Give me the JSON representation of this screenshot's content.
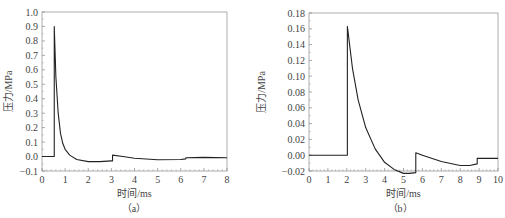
{
  "chart_data": [
    {
      "type": "line",
      "panel": "a",
      "caption": "（a）",
      "title": "",
      "xlabel": "时间/ms",
      "ylabel": "压力/MPa",
      "xlim": [
        0,
        8
      ],
      "ylim": [
        -0.1,
        1.0
      ],
      "xticks": [
        "0",
        "1",
        "2",
        "3",
        "4",
        "5",
        "6",
        "7",
        "8"
      ],
      "yticks": [
        "1.0",
        "0.9",
        "0.8",
        "0.7",
        "0.6",
        "0.5",
        "0.4",
        "0.3",
        "0.2",
        "0.1",
        "0.0",
        "−0.1"
      ],
      "grid": false,
      "legend": null,
      "series": [
        {
          "name": "pressure",
          "x": [
            0,
            0.53,
            0.53,
            0.6,
            0.7,
            0.8,
            0.9,
            1.0,
            1.2,
            1.5,
            2.0,
            2.5,
            3.0,
            3.05,
            3.05,
            3.5,
            4.0,
            5.0,
            6.0,
            6.22,
            6.22,
            7.0,
            8.0
          ],
          "y": [
            0.0,
            0.0,
            0.9,
            0.55,
            0.3,
            0.16,
            0.09,
            0.05,
            0.01,
            -0.02,
            -0.035,
            -0.035,
            -0.03,
            -0.03,
            0.01,
            0.0,
            -0.012,
            -0.022,
            -0.02,
            -0.016,
            -0.008,
            -0.006,
            -0.008
          ]
        }
      ]
    },
    {
      "type": "line",
      "panel": "b",
      "caption": "（b）",
      "title": "",
      "xlabel": "时间/ms",
      "ylabel": "压力/MPa",
      "xlim": [
        0,
        10
      ],
      "ylim": [
        -0.02,
        0.18
      ],
      "xticks": [
        "0",
        "1",
        "2",
        "3",
        "4",
        "5",
        "6",
        "7",
        "8",
        "9",
        "10"
      ],
      "yticks": [
        "0.18",
        "0.16",
        "0.14",
        "0.12",
        "0.10",
        "0.08",
        "0.06",
        "0.04",
        "0.02",
        "0.00",
        "−0.02"
      ],
      "grid": false,
      "legend": null,
      "series": [
        {
          "name": "pressure",
          "x": [
            0,
            2.03,
            2.03,
            2.3,
            2.6,
            3.0,
            3.5,
            4.0,
            4.5,
            5.0,
            5.3,
            5.65,
            5.65,
            6.0,
            7.0,
            8.0,
            8.5,
            8.9,
            8.9,
            9.5,
            10.0
          ],
          "y": [
            0.0,
            0.0,
            0.163,
            0.11,
            0.07,
            0.035,
            0.008,
            -0.009,
            -0.018,
            -0.023,
            -0.023,
            -0.022,
            0.003,
            0.0,
            -0.008,
            -0.013,
            -0.013,
            -0.011,
            -0.004,
            -0.004,
            -0.004
          ]
        }
      ]
    }
  ]
}
